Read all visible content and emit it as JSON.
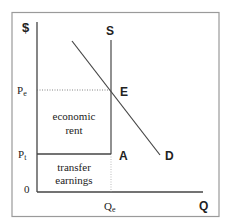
{
  "diagram": {
    "axes": {
      "y_label": "$",
      "x_label": "Q",
      "origin_label": "0"
    },
    "price_labels": {
      "equilibrium": "P",
      "equilibrium_sub": "e",
      "transfer": "P",
      "transfer_sub": "t"
    },
    "quantity_labels": {
      "equilibrium": "Q",
      "equilibrium_sub": "e"
    },
    "curves": {
      "supply": "S",
      "demand": "D"
    },
    "points": {
      "equilibrium": "E",
      "transfer_point": "A"
    },
    "regions": {
      "upper_line1": "economic",
      "upper_line2": "rent",
      "lower_line1": "transfer",
      "lower_line2": "earnings"
    },
    "colors": {
      "line": "#444444",
      "frame": "#9a9a9a",
      "text": "#222222"
    }
  }
}
